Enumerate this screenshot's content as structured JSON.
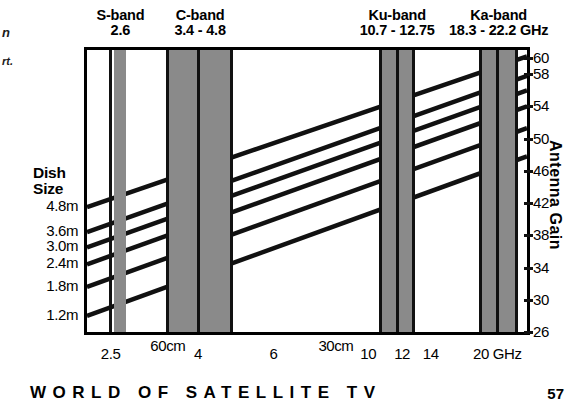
{
  "margin_notes": {
    "line1": "n",
    "line2": "rt."
  },
  "chart_data": {
    "type": "line",
    "xlabel": "Frequency (GHz)",
    "ylabel": "Antenna Gain",
    "xlim": [
      2.2,
      23.5
    ],
    "ylim": [
      26,
      61
    ],
    "xscale": "log",
    "grid": false,
    "legend": "left-axis-dish-size-labels",
    "x_ticks": [
      {
        "value": 2.5,
        "label": "2.5"
      },
      {
        "value": 4,
        "label": "4"
      },
      {
        "value": 6,
        "label": "6"
      },
      {
        "value": 10,
        "label": "10"
      },
      {
        "value": 12,
        "label": "12"
      },
      {
        "value": 14,
        "label": "14"
      },
      {
        "value": 20,
        "label": "20 GHz"
      }
    ],
    "wavelength_annotations": [
      {
        "value": 3.4,
        "label": "60cm"
      },
      {
        "value": 8.4,
        "label": "30cm"
      }
    ],
    "y_ticks": [
      {
        "value": 60,
        "label": "60"
      },
      {
        "value": 58,
        "label": "58"
      },
      {
        "value": 54,
        "label": "54"
      },
      {
        "value": 50,
        "label": "50"
      },
      {
        "value": 46,
        "label": "46"
      },
      {
        "value": 42,
        "label": "42"
      },
      {
        "value": 38,
        "label": "38"
      },
      {
        "value": 34,
        "label": "34"
      },
      {
        "value": 30,
        "label": "30"
      },
      {
        "value": 26,
        "label": "26"
      }
    ],
    "series": [
      {
        "name": "4.8m",
        "label": "4.8m",
        "start_gain": 41.5,
        "end_gain": 60.2
      },
      {
        "name": "3.6m",
        "label": "3.6m",
        "start_gain": 38.4,
        "end_gain": 57.8
      },
      {
        "name": "3.0m",
        "label": "3.0m",
        "start_gain": 36.5,
        "end_gain": 56.0
      },
      {
        "name": "2.4m",
        "label": "2.4m",
        "start_gain": 34.4,
        "end_gain": 54.0
      },
      {
        "name": "1.8m",
        "label": "1.8m",
        "start_gain": 31.6,
        "end_gain": 51.3
      },
      {
        "name": "1.2m",
        "label": "1.2m",
        "start_gain": 28.0,
        "end_gain": 47.8
      }
    ],
    "bands": [
      {
        "name": "S-band",
        "range": "2.6",
        "from": 2.55,
        "to": 2.72
      },
      {
        "name": "C-band",
        "range": "3.4 - 4.8",
        "from": 3.4,
        "to": 4.8
      },
      {
        "name": "Ku-band",
        "range": "10.7 - 12.75",
        "from": 10.7,
        "to": 12.75
      },
      {
        "name": "Ka-band",
        "range": "18.3 - 22.2 GHz",
        "from": 18.3,
        "to": 22.2
      }
    ]
  },
  "axes": {
    "dish_size_heading_line1": "Dish",
    "dish_size_heading_line2": "Size",
    "gain_axis_title": "Antenna Gain"
  },
  "footer": {
    "title": "WORLD OF SATELLITE TV",
    "page": "57"
  }
}
